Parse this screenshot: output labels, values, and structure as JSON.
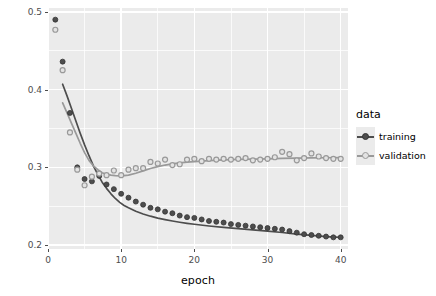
{
  "chart_data": {
    "type": "scatter",
    "title": "",
    "xlabel": "epoch",
    "ylabel": "loss",
    "xlim": [
      0,
      41
    ],
    "ylim": [
      0.195,
      0.505
    ],
    "grid": true,
    "legend_position": "right",
    "legend_title": "data",
    "x_ticks": [
      "0",
      "10",
      "20",
      "30",
      "40"
    ],
    "x_tick_values": [
      0,
      10,
      20,
      30,
      40
    ],
    "x_minor_values": [
      5,
      15,
      25,
      35
    ],
    "y_ticks": [
      "0.2",
      "0.3",
      "0.4",
      "0.5"
    ],
    "y_tick_values": [
      0.2,
      0.3,
      0.4,
      0.5
    ],
    "y_minor_values": [
      0.25,
      0.35,
      0.45
    ],
    "colors": {
      "training": "#4d4d4d",
      "validation": "#999999",
      "panel_background": "#ebebeb",
      "gridline": "#ffffff",
      "axis_text": "#4d4d4d",
      "axis_title": "#000000"
    },
    "series": [
      {
        "name": "training",
        "color": "#4d4d4d",
        "marker": "filled-circle",
        "has_smooth_line": true,
        "x": [
          1,
          2,
          3,
          4,
          5,
          6,
          7,
          8,
          9,
          10,
          11,
          12,
          13,
          14,
          15,
          16,
          17,
          18,
          19,
          20,
          21,
          22,
          23,
          24,
          25,
          26,
          27,
          28,
          29,
          30,
          31,
          32,
          33,
          34,
          35,
          36,
          37,
          38,
          39,
          40
        ],
        "y": [
          0.49,
          0.436,
          0.37,
          0.3,
          0.285,
          0.282,
          0.289,
          0.278,
          0.272,
          0.266,
          0.261,
          0.256,
          0.252,
          0.248,
          0.246,
          0.243,
          0.241,
          0.238,
          0.236,
          0.235,
          0.233,
          0.231,
          0.23,
          0.229,
          0.227,
          0.226,
          0.225,
          0.224,
          0.223,
          0.222,
          0.221,
          0.22,
          0.218,
          0.216,
          0.214,
          0.213,
          0.212,
          0.211,
          0.21,
          0.21
        ]
      },
      {
        "name": "validation",
        "color": "#999999",
        "marker": "open-circle",
        "has_smooth_line": true,
        "x": [
          1,
          2,
          3,
          4,
          5,
          6,
          7,
          8,
          9,
          10,
          11,
          12,
          13,
          14,
          15,
          16,
          17,
          18,
          19,
          20,
          21,
          22,
          23,
          24,
          25,
          26,
          27,
          28,
          29,
          30,
          31,
          32,
          33,
          34,
          35,
          36,
          37,
          38,
          39,
          40
        ],
        "y": [
          0.477,
          0.425,
          0.345,
          0.297,
          0.277,
          0.288,
          0.292,
          0.29,
          0.296,
          0.29,
          0.297,
          0.299,
          0.299,
          0.307,
          0.305,
          0.31,
          0.303,
          0.304,
          0.31,
          0.311,
          0.308,
          0.311,
          0.31,
          0.311,
          0.31,
          0.311,
          0.312,
          0.309,
          0.31,
          0.311,
          0.313,
          0.32,
          0.317,
          0.309,
          0.312,
          0.318,
          0.314,
          0.312,
          0.311,
          0.311
        ]
      }
    ],
    "smooth_lines": [
      {
        "name": "training",
        "color": "#4d4d4d",
        "x": [
          2.0,
          2.6,
          3.2,
          3.8,
          4.4,
          5.0,
          5.6,
          6.2,
          6.8,
          7.4,
          8.0,
          8.6,
          9.2,
          9.8,
          10.4,
          11.0,
          12.0,
          13.0,
          14.0,
          15.0,
          16.0,
          17.0,
          18.0,
          19.0,
          20.0,
          22.0,
          24.0,
          26.0,
          28.0,
          30.0,
          32.0,
          34.0,
          36.0,
          38.0,
          40.0
        ],
        "y": [
          0.407,
          0.392,
          0.376,
          0.36,
          0.344,
          0.329,
          0.315,
          0.302,
          0.291,
          0.281,
          0.273,
          0.266,
          0.26,
          0.255,
          0.251,
          0.248,
          0.2435,
          0.24,
          0.2372,
          0.2348,
          0.2328,
          0.231,
          0.2294,
          0.228,
          0.2268,
          0.2246,
          0.2228,
          0.2212,
          0.2196,
          0.218,
          0.2162,
          0.2142,
          0.2124,
          0.211,
          0.21
        ]
      },
      {
        "name": "validation",
        "color": "#999999",
        "x": [
          2.0,
          2.6,
          3.2,
          3.8,
          4.4,
          5.0,
          5.6,
          6.2,
          6.8,
          7.4,
          8.0,
          8.6,
          9.2,
          9.8,
          10.4,
          11.0,
          12.0,
          13.0,
          14.0,
          15.0,
          16.0,
          17.0,
          18.0,
          19.0,
          20.0,
          22.0,
          24.0,
          26.0,
          28.0,
          30.0,
          32.0,
          34.0,
          36.0,
          38.0,
          40.0
        ],
        "y": [
          0.383,
          0.37,
          0.357,
          0.344,
          0.331,
          0.319,
          0.309,
          0.302,
          0.297,
          0.293,
          0.291,
          0.29,
          0.2893,
          0.289,
          0.2893,
          0.29,
          0.2925,
          0.2955,
          0.2985,
          0.301,
          0.303,
          0.3045,
          0.3058,
          0.3068,
          0.3075,
          0.3088,
          0.3096,
          0.3102,
          0.3106,
          0.311,
          0.3115,
          0.3118,
          0.3122,
          0.3124,
          0.3125
        ]
      }
    ],
    "legend_entries": [
      {
        "label": "training",
        "color": "#4d4d4d",
        "marker": "filled-circle"
      },
      {
        "label": "validation",
        "color": "#999999",
        "marker": "open-circle"
      }
    ]
  }
}
